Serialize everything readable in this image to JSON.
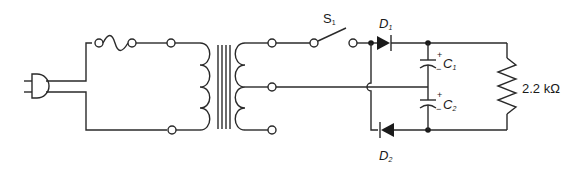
{
  "diagram": {
    "components": {
      "switch": {
        "label": "S",
        "subscript": "1"
      },
      "diode1": {
        "label": "D",
        "subscript": "1"
      },
      "diode2": {
        "label": "D",
        "subscript": "2"
      },
      "capacitor1": {
        "label": "C",
        "subscript": "1",
        "plus": "+",
        "minus": "−"
      },
      "capacitor2": {
        "label": "C",
        "subscript": "2",
        "plus": "+",
        "minus": "−"
      },
      "resistor": {
        "label": "2.2 kΩ"
      }
    },
    "other_elements": [
      "ac-plug",
      "fuse",
      "transformer",
      "terminals"
    ]
  },
  "colors": {
    "line": "#2a2a2a",
    "background": "#ffffff"
  }
}
